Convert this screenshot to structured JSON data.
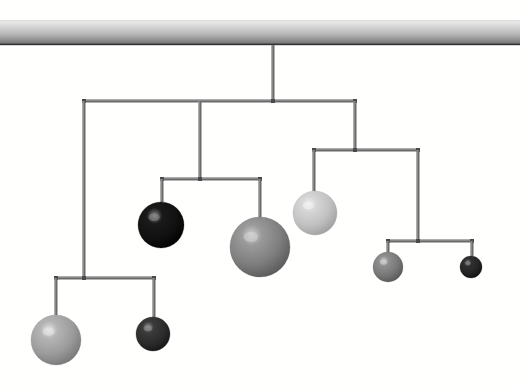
{
  "scene": {
    "title": "Hanging Mobile",
    "width": 520,
    "height": 388,
    "background_color": "#fffffe"
  },
  "ceiling": {
    "label": "ceiling-beam",
    "x": 0,
    "y": 20,
    "width": 520,
    "height": 25,
    "gradient_top_color": "#f0f0f0",
    "gradient_bottom_color": "#6e6e6e",
    "edge_color": "#333333"
  },
  "rod": {
    "color": "#6b6b6b",
    "highlight_color": "#a8a8a8",
    "thickness": 3,
    "joint_color": "#4a4a4a",
    "joint_size": 4
  },
  "main_stem": {
    "label": "main-suspension-stem",
    "x": 273,
    "y_top": 45,
    "y_bottom": 101
  },
  "bars": [
    {
      "id": "bar-level-1",
      "label": "top-crossbar",
      "y": 101,
      "x_left": 84,
      "x_right": 355,
      "pivot_x": 273,
      "drops": [
        {
          "label": "drop-to-left-branch",
          "x": 84,
          "y_bottom": 278
        },
        {
          "label": "drop-to-middle-branch",
          "x": 200,
          "y_bottom": 179
        },
        {
          "label": "drop-to-right-branch",
          "x": 355,
          "y_bottom": 150
        }
      ]
    },
    {
      "id": "bar-level-2-right",
      "label": "right-crossbar",
      "y": 150,
      "x_left": 314,
      "x_right": 418,
      "pivot_x": 355,
      "drops": [
        {
          "label": "drop-to-ball-pale-large",
          "x": 314,
          "y_bottom": 191
        },
        {
          "label": "drop-to-lower-right-branch",
          "x": 418,
          "y_bottom": 241
        }
      ]
    },
    {
      "id": "bar-level-2-middle",
      "label": "middle-crossbar",
      "y": 179,
      "x_left": 162,
      "x_right": 260,
      "pivot_x": 200,
      "drops": [
        {
          "label": "drop-to-ball-black",
          "x": 162,
          "y_bottom": 202
        },
        {
          "label": "drop-to-ball-gray-largest",
          "x": 260,
          "y_bottom": 217
        }
      ]
    },
    {
      "id": "bar-level-3-right",
      "label": "lower-right-crossbar",
      "y": 241,
      "x_left": 388,
      "x_right": 472,
      "pivot_x": 418,
      "drops": [
        {
          "label": "drop-to-ball-gray-small",
          "x": 388,
          "y_bottom": 252
        },
        {
          "label": "drop-to-ball-dark-smallest",
          "x": 472,
          "y_bottom": 256
        }
      ]
    },
    {
      "id": "bar-level-2-left",
      "label": "left-crossbar",
      "y": 278,
      "x_left": 56,
      "x_right": 154,
      "pivot_x": 84,
      "drops": [
        {
          "label": "drop-to-ball-pale-bottom-left",
          "x": 56,
          "y_bottom": 315
        },
        {
          "label": "drop-to-ball-dark-bottom-middle",
          "x": 154,
          "y_bottom": 317
        }
      ]
    }
  ],
  "balls": [
    {
      "id": "ball-black",
      "label": "ball-black-medium",
      "cx": 161,
      "cy": 225,
      "r": 23,
      "base_color": "#1a1a1a",
      "mid_color": "#111111",
      "shadow_color": "#000000",
      "highlight_color": "#8a8a8a",
      "tone": "black"
    },
    {
      "id": "ball-gray-largest",
      "label": "ball-gray-large",
      "cx": 260,
      "cy": 247,
      "r": 30,
      "base_color": "#9a9a9a",
      "mid_color": "#7e7e7e",
      "shadow_color": "#565656",
      "highlight_color": "#d2d2d2",
      "tone": "mid-gray"
    },
    {
      "id": "ball-pale-large",
      "label": "ball-pale-medium",
      "cx": 315,
      "cy": 213,
      "r": 22,
      "base_color": "#d6d6d6",
      "mid_color": "#c0c0c0",
      "shadow_color": "#9c9c9c",
      "highlight_color": "#f2f2f2",
      "tone": "pale-gray"
    },
    {
      "id": "ball-pale-bottom-left",
      "label": "ball-pale-large-bottom-left",
      "cx": 56,
      "cy": 340,
      "r": 25,
      "base_color": "#b4b4b4",
      "mid_color": "#9b9b9b",
      "shadow_color": "#747474",
      "highlight_color": "#e6e6e6",
      "tone": "light-gray"
    },
    {
      "id": "ball-dark-bottom-middle",
      "label": "ball-dark-small-bottom-middle",
      "cx": 153,
      "cy": 334,
      "r": 17,
      "base_color": "#3a3a3a",
      "mid_color": "#2c2c2c",
      "shadow_color": "#141414",
      "highlight_color": "#8f8f8f",
      "tone": "dark-gray"
    },
    {
      "id": "ball-gray-small",
      "label": "ball-gray-small-right",
      "cx": 388,
      "cy": 267,
      "r": 15,
      "base_color": "#8e8e8e",
      "mid_color": "#777777",
      "shadow_color": "#535353",
      "highlight_color": "#cfcfcf",
      "tone": "mid-gray"
    },
    {
      "id": "ball-dark-smallest",
      "label": "ball-dark-smallest-far-right",
      "cx": 471,
      "cy": 267,
      "r": 11,
      "base_color": "#303030",
      "mid_color": "#242424",
      "shadow_color": "#0f0f0f",
      "highlight_color": "#858585",
      "tone": "dark-gray"
    }
  ]
}
